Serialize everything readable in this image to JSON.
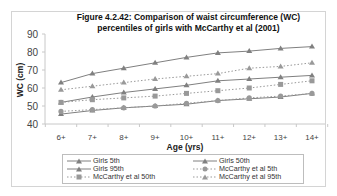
{
  "title_line1": "Figure 4.2.42: Comparison of waist circumference (WC)",
  "title_line2": "percentiles of girls with McCarthy et al (2001)",
  "chart_data": {
    "type": "line",
    "title": "Figure 4.2.42: Comparison of waist circumference (WC) percentiles of girls with McCarthy et al (2001)",
    "xlabel": "Age (yrs)",
    "ylabel": "WC (cm)",
    "ylim": [
      40,
      90
    ],
    "yticks": [
      40,
      50,
      60,
      70,
      80,
      90
    ],
    "categories": [
      "6+",
      "7+",
      "8+",
      "9+",
      "10+",
      "11+",
      "12+",
      "13+",
      "14+"
    ],
    "grid": false,
    "legend_position": "bottom",
    "series": [
      {
        "name": "Girls 5th",
        "style": "solid",
        "marker": "triangle",
        "color": "#808080",
        "values": [
          45.5,
          47.5,
          49,
          50,
          51,
          53,
          54,
          55,
          57
        ]
      },
      {
        "name": "Girls 50th",
        "style": "solid",
        "marker": "triangle",
        "color": "#808080",
        "values": [
          52,
          55,
          57.5,
          59.5,
          61.5,
          64,
          65,
          66,
          67
        ]
      },
      {
        "name": "Girls 95th",
        "style": "solid",
        "marker": "triangle",
        "color": "#808080",
        "values": [
          63,
          68,
          71,
          74,
          77,
          79.5,
          80.5,
          82,
          83
        ]
      },
      {
        "name": "McCarthy et al 5th",
        "style": "dotted",
        "marker": "circle",
        "color": "#999999",
        "values": [
          47,
          48,
          49,
          50,
          51.5,
          53,
          54.5,
          55.5,
          57
        ]
      },
      {
        "name": "McCarthy et al 50th",
        "style": "dotted",
        "marker": "square",
        "color": "#999999",
        "values": [
          52,
          53.5,
          54.5,
          55.5,
          57,
          58.5,
          60,
          62,
          64
        ]
      },
      {
        "name": "McCarthy et al 95th",
        "style": "dotted",
        "marker": "triangle",
        "color": "#999999",
        "values": [
          59,
          61,
          63,
          65,
          66.5,
          68,
          71,
          72,
          74
        ]
      }
    ]
  },
  "legend": [
    {
      "label": "Girls 5th"
    },
    {
      "label": "Girls 50th"
    },
    {
      "label": "Girls 95th"
    },
    {
      "label": "McCarthy et al 5th"
    },
    {
      "label": "McCarthy et al 50th"
    },
    {
      "label": "McCarthy et al 95th"
    }
  ]
}
